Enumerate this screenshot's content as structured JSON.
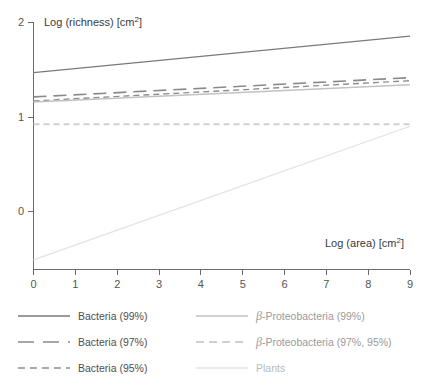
{
  "chart_data": {
    "type": "line",
    "title": "",
    "xlabel": "Log (area) [cm2]",
    "ylabel": "Log (richness) [cm2]",
    "xlim": [
      0,
      9
    ],
    "ylim": [
      -0.45,
      2.0
    ],
    "xticks": [
      "0",
      "1",
      "2",
      "3",
      "4",
      "5",
      "6",
      "7",
      "8",
      "9"
    ],
    "yticks": [
      "0",
      "1",
      "2"
    ],
    "grid": false,
    "legend_position": "bottom",
    "series": [
      {
        "name": "Bacteria (99%)",
        "style": "solid",
        "color": "#7a7a7a",
        "x": [
          0,
          9
        ],
        "values": [
          1.5,
          1.86
        ],
        "slope": 0.04,
        "intercept": 1.5
      },
      {
        "name": "Bacteria (97%)",
        "style": "long-dashed",
        "color": "#8a8a8a",
        "x": [
          0,
          9
        ],
        "values": [
          1.26,
          1.45
        ],
        "slope": 0.021,
        "intercept": 1.26
      },
      {
        "name": "Bacteria (95%)",
        "style": "dashed",
        "color": "#8f8f8f",
        "x": [
          0,
          9
        ],
        "values": [
          1.22,
          1.42
        ],
        "slope": 0.022,
        "intercept": 1.22
      },
      {
        "name": "β-Proteobacteria (99%)",
        "style": "solid",
        "color": "#c2c2c2",
        "x": [
          0,
          9
        ],
        "values": [
          1.21,
          1.38
        ],
        "slope": 0.019,
        "intercept": 1.21
      },
      {
        "name": "β-Proteobacteria (97%, 95%)",
        "style": "dashed",
        "color": "#cfcfcf",
        "x": [
          0,
          9
        ],
        "values": [
          0.99,
          0.99
        ],
        "slope": 0.0,
        "intercept": 0.99
      },
      {
        "name": "Plants",
        "style": "solid",
        "color": "#e2e2e2",
        "x": [
          0,
          9
        ],
        "values": [
          -0.35,
          0.97
        ],
        "slope": 0.147,
        "intercept": -0.35
      }
    ]
  },
  "axes": {
    "y_title_text": "Log (richness) [cm",
    "y_title_sup": "2",
    "y_title_close": "]",
    "x_title_text": "Log (area) [cm",
    "x_title_sup": "2",
    "x_title_close": "]",
    "y_tick_2": "2",
    "y_tick_1": "1",
    "y_tick_0": "0",
    "x_tick_0": "0",
    "x_tick_1": "1",
    "x_tick_2": "2",
    "x_tick_3": "3",
    "x_tick_4": "4",
    "x_tick_5": "5",
    "x_tick_6": "6",
    "x_tick_7": "7",
    "x_tick_8": "8",
    "x_tick_9": "9"
  },
  "legend": {
    "left": [
      {
        "label": "Bacteria (99%)",
        "style": "solid",
        "color": "#7a7a7a",
        "tone": "dark"
      },
      {
        "label": "Bacteria (97%)",
        "style": "long-dashed",
        "color": "#8a8a8a",
        "tone": "dark"
      },
      {
        "label": "Bacteria (95%)",
        "style": "dashed",
        "color": "#8f8f8f",
        "tone": "dark"
      }
    ],
    "right": [
      {
        "beta": "β",
        "label": "-Proteobacteria (99%)",
        "style": "solid",
        "color": "#c2c2c2",
        "tone": "mid"
      },
      {
        "beta": "β",
        "label": "-Proteobacteria (97%, 95%)",
        "style": "dashed",
        "color": "#cfcfcf",
        "tone": "mid"
      },
      {
        "beta": "",
        "label": "Plants",
        "style": "solid",
        "color": "#e2e2e2",
        "tone": "faint"
      }
    ]
  },
  "colors": {
    "axis": "#6b6b6b",
    "text": "#4f4f4f",
    "background": "#ffffff"
  }
}
